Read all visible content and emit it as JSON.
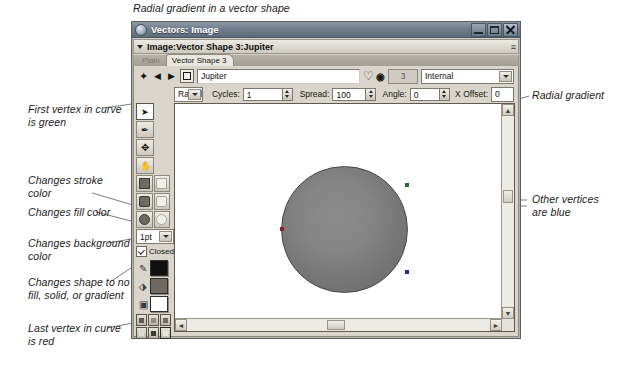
{
  "figure": {
    "caption": "Radial gradient in a vector shape"
  },
  "window": {
    "title": "Vectors: Image",
    "icon": "app-icon",
    "buttons": {
      "minimize": "–",
      "maximize": "□",
      "close": "✕"
    }
  },
  "document_bar": {
    "title": "Image:Vector Shape 3:Jupiter",
    "menu_glyph": "≡"
  },
  "tabs": [
    {
      "label": "Plain",
      "active": false
    },
    {
      "label": "Vector Shape 3",
      "active": true
    }
  ],
  "name_row": {
    "prev_all_icon": "first-vertex-icon",
    "prev_icon": "previous-vertex-icon",
    "next_icon": "next-vertex-icon",
    "shape_icon": "vector-shape-icon",
    "name_value": "Jupiter",
    "name_placeholder": "Shape name",
    "stroke_glyph": "path-icon",
    "info_glyph": "0",
    "count_value": "3",
    "source_value": "Internal"
  },
  "gradient_row": {
    "type_value": "Radial",
    "cycles_label": "Cycles:",
    "cycles_value": "1",
    "spread_label": "Spread:",
    "spread_value": "100",
    "angle_label": "Angle:",
    "angle_value": "0",
    "xoffset_label": "X Offset:",
    "xoffset_value": "0"
  },
  "tools": {
    "buttons": [
      {
        "name": "pointer-tool",
        "glyph": "➤",
        "selected": true
      },
      {
        "name": "pen-tool",
        "glyph": "✒",
        "selected": false
      },
      {
        "name": "move-tool",
        "glyph": "✥",
        "selected": false
      },
      {
        "name": "hand-tool",
        "glyph": "✋",
        "selected": false
      }
    ],
    "shape_swatches": [
      {
        "name": "solid-square-swatch",
        "kind": "square",
        "fill": true
      },
      {
        "name": "empty-square-swatch",
        "kind": "square",
        "fill": false
      },
      {
        "name": "solid-rounded-swatch",
        "kind": "square-round",
        "fill": true
      },
      {
        "name": "empty-rounded-swatch",
        "kind": "square-round",
        "fill": false
      },
      {
        "name": "solid-circle-swatch",
        "kind": "circle",
        "fill": true
      },
      {
        "name": "empty-circle-swatch",
        "kind": "circle",
        "fill": false
      }
    ],
    "width_value": "1pt",
    "closed_label": "Closed",
    "closed_checked": true,
    "stroke_color": "#101010",
    "fill_color": "#6e6a62",
    "background_color": "#ffffff",
    "mini_row_1": [
      "#5c5850",
      "#8f8b82",
      "#6f6b63"
    ],
    "mini_row_2": [
      "#dedad2",
      "#3a3a36",
      "#e9e6df"
    ]
  },
  "canvas": {
    "shape_name": "radial-gradient-circle",
    "vertices": [
      {
        "name": "first-vertex",
        "x": 231,
        "y": 68,
        "color": "#2b7d2b"
      },
      {
        "name": "vertex-right",
        "x": 232,
        "y": 180,
        "color": "#2b2b8f"
      },
      {
        "name": "last-vertex",
        "x": 107,
        "y": 124,
        "color": "#a02020"
      }
    ]
  },
  "scrollbars": {
    "v_up": "▲",
    "v_down": "▼",
    "h_left": "◄",
    "h_right": "►"
  },
  "callouts": {
    "first_vertex": "First vertex in curve\nis green",
    "stroke_color": "Changes stroke\ncolor",
    "fill_color": "Changes fill color",
    "background_color": "Changes background\ncolor",
    "shape_mode": "Changes shape to no\nfill, solid, or gradient",
    "last_vertex": "Last vertex in curve\nis red",
    "radial_gradient": "Radial gradient",
    "other_vertices": "Other vertices\nare blue"
  }
}
